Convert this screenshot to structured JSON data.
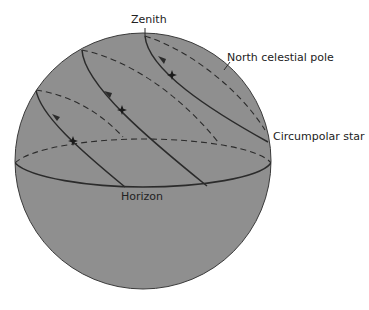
{
  "diagram": {
    "labels": {
      "zenith": "Zenith",
      "north_celestial_pole": "North celestial pole",
      "circumpolar_star": "Circumpolar star",
      "horizon": "Horizon"
    },
    "colors": {
      "sphere_fill": "#8f8f8f",
      "line": "#2b2b2b",
      "text": "#222222",
      "background": "#ffffff"
    },
    "stars": [
      {
        "name": "star-1",
        "x": 73,
        "y": 141
      },
      {
        "name": "star-2",
        "x": 122,
        "y": 110
      },
      {
        "name": "star-3",
        "x": 172,
        "y": 75
      }
    ]
  }
}
